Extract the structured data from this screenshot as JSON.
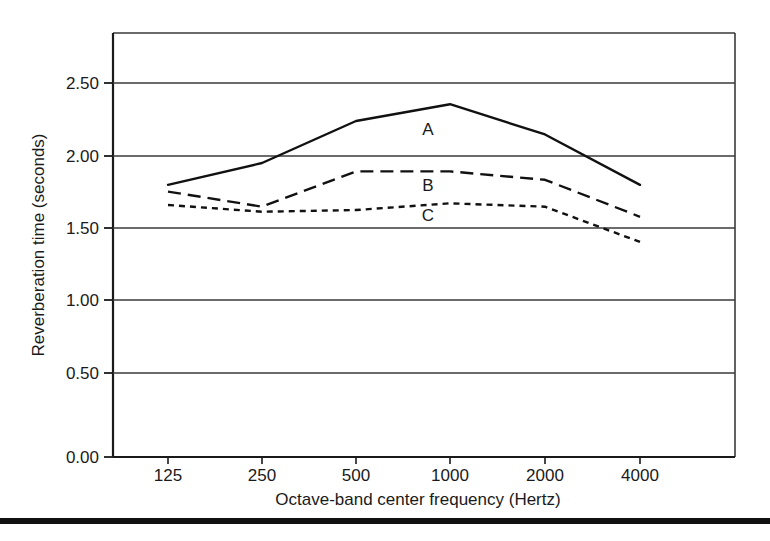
{
  "chart_data": {
    "type": "line",
    "title": "",
    "xlabel": "Octave-band center frequency (Hertz)",
    "ylabel": "Reverberation time (seconds)",
    "categories": [
      "125",
      "250",
      "500",
      "1000",
      "2000",
      "4000"
    ],
    "x_tick_labels": [
      "125",
      "250",
      "500",
      "1000",
      "2000",
      "4000"
    ],
    "y_tick_labels": [
      "0.00",
      "0.50",
      "1.00",
      "1.50",
      "2.00",
      "2.50"
    ],
    "y_tick_values": [
      0.0,
      0.5,
      1.0,
      1.5,
      2.0,
      2.5
    ],
    "ylim": [
      0.0,
      2.75
    ],
    "xlim_categories_spacing": "equal-octave",
    "grid": "horizontal-only",
    "legend": "inline-labels",
    "legend_position": "inline, near 1000 Hz",
    "axis_color": "#1a1a1a",
    "grid_color": "#3a3a3a",
    "series": [
      {
        "name": "A",
        "label": "A",
        "style": "solid",
        "color": "#111111",
        "label_x_category": "1000",
        "values": [
          1.62,
          1.75,
          2.0,
          2.1,
          1.92,
          1.62
        ]
      },
      {
        "name": "B",
        "label": "B",
        "style": "dashed",
        "color": "#111111",
        "label_x_category": "1000",
        "values": [
          1.58,
          1.49,
          1.7,
          1.7,
          1.65,
          1.43
        ]
      },
      {
        "name": "C",
        "label": "C",
        "style": "dotted",
        "color": "#111111",
        "label_x_category": "1000",
        "values": [
          1.5,
          1.46,
          1.47,
          1.51,
          1.49,
          1.28
        ]
      }
    ]
  },
  "footer": {
    "rule": "thick-black-bar"
  }
}
